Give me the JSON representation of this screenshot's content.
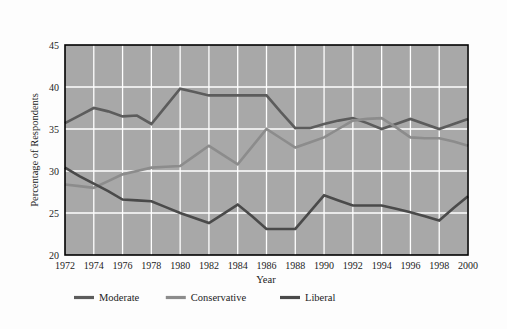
{
  "chart_data": {
    "type": "line",
    "title": "",
    "xlabel": "Year",
    "ylabel": "Percentage of Respondents",
    "x": [
      1972,
      1974,
      1976,
      1978,
      1980,
      1982,
      1984,
      1986,
      1988,
      1990,
      1992,
      1994,
      1996,
      1998,
      2000
    ],
    "xtick_labels": [
      "1972",
      "1974",
      "1976",
      "1978",
      "1980",
      "1982",
      "1984",
      "1986",
      "1988",
      "1990",
      "1992",
      "1994",
      "1996",
      "1998",
      "2000"
    ],
    "ytick_labels": [
      "20",
      "25",
      "30",
      "35",
      "40",
      "45"
    ],
    "yticks": [
      20,
      25,
      30,
      35,
      40,
      45
    ],
    "xlim": [
      1972,
      2000
    ],
    "ylim": [
      20,
      45
    ],
    "grid": true,
    "legend_position": "below",
    "plot_background": "#a8a8a8",
    "gridline_color": "#ffffff",
    "series": [
      {
        "name": "Moderate",
        "color": "#5c5c5c",
        "x": [
          1972,
          1973,
          1974,
          1975,
          1976,
          1977,
          1978,
          1979,
          1980,
          1981,
          1982,
          1983,
          1984,
          1985,
          1986,
          1987,
          1988,
          1989,
          1990,
          1991,
          1992,
          1993,
          1994,
          1995,
          1996,
          1997,
          1998,
          1999,
          2000
        ],
        "values": [
          35.7,
          36.6,
          37.5,
          37.1,
          36.5,
          36.6,
          35.6,
          37.7,
          39.8,
          39.4,
          39.0,
          39.0,
          39.0,
          39.0,
          39.0,
          37.0,
          35.1,
          35.1,
          35.6,
          36.0,
          36.3,
          35.7,
          35.0,
          35.6,
          36.2,
          35.6,
          35.0,
          35.6,
          36.2
        ]
      },
      {
        "name": "Conservative",
        "color": "#8c8c8c",
        "x": [
          1972,
          1973,
          1974,
          1975,
          1976,
          1977,
          1978,
          1979,
          1980,
          1981,
          1982,
          1983,
          1984,
          1985,
          1986,
          1987,
          1988,
          1989,
          1990,
          1991,
          1992,
          1993,
          1994,
          1995,
          1996,
          1997,
          1998,
          1999,
          2000
        ],
        "values": [
          28.4,
          28.2,
          28.0,
          28.8,
          29.6,
          30.0,
          30.4,
          30.5,
          30.6,
          31.8,
          33.0,
          31.9,
          30.8,
          32.9,
          35.0,
          33.9,
          32.8,
          33.4,
          34.0,
          35.0,
          36.0,
          36.2,
          36.3,
          35.2,
          34.0,
          33.9,
          33.9,
          33.5,
          33.0
        ]
      },
      {
        "name": "Liberal",
        "color": "#4a4a4a",
        "x": [
          1972,
          1973,
          1974,
          1975,
          1976,
          1977,
          1978,
          1979,
          1980,
          1981,
          1982,
          1983,
          1984,
          1985,
          1986,
          1987,
          1988,
          1989,
          1990,
          1991,
          1992,
          1993,
          1994,
          1995,
          1996,
          1997,
          1998,
          1999,
          2000
        ],
        "values": [
          30.4,
          29.4,
          28.5,
          27.6,
          26.6,
          26.5,
          26.4,
          25.7,
          25.0,
          24.4,
          23.8,
          24.9,
          26.0,
          24.6,
          23.1,
          23.1,
          23.1,
          25.1,
          27.1,
          26.5,
          25.9,
          25.9,
          25.9,
          25.5,
          25.1,
          24.6,
          24.1,
          25.6,
          27.0
        ]
      }
    ],
    "series_endpoints": {
      "Liberal_final": 26.0
    }
  },
  "legend": {
    "items": [
      {
        "label": "Moderate",
        "color": "#5c5c5c"
      },
      {
        "label": "Conservative",
        "color": "#8c8c8c"
      },
      {
        "label": "Liberal",
        "color": "#4a4a4a"
      }
    ]
  },
  "axis": {
    "x_title": "Year",
    "y_title": "Percentage of Respondents"
  }
}
